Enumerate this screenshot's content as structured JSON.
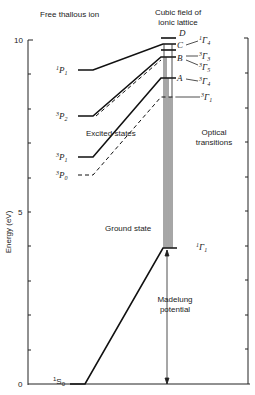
{
  "titles": {
    "left": "Free thallous ion",
    "right_line1": "Cubic field of",
    "right_line2": "ionic lattice"
  },
  "axis": {
    "ylabel": "Energy (eV)",
    "tick_10": "10",
    "tick_5": "5",
    "tick_0": "0"
  },
  "free_ion_levels": {
    "P1_singlet": {
      "sup": "1",
      "letter": "P",
      "sub": "1"
    },
    "P2": {
      "sup": "3",
      "letter": "P",
      "sub": "2"
    },
    "P1_triplet": {
      "sup": "3",
      "letter": "P",
      "sub": "1"
    },
    "P0": {
      "sup": "3",
      "letter": "P",
      "sub": "0"
    },
    "S0": {
      "sup": "1",
      "letter": "S",
      "sub": "0"
    }
  },
  "lattice_levels": {
    "D": "D",
    "C": "C",
    "B": "B",
    "A": "A",
    "C_state": {
      "sup": "1",
      "sub": "4",
      "over": "0"
    },
    "B_state1": {
      "sup": "3",
      "sub": "3",
      "over": "0"
    },
    "B_state2": {
      "sup": "3",
      "sub": "5",
      "over": "0"
    },
    "A_state": {
      "sup": "3",
      "sub": "4",
      "over": "0"
    },
    "lowest_state": {
      "sup": "3",
      "sub": "1",
      "over": "0"
    },
    "ground_state": {
      "sup": "1",
      "sub": "1",
      "over": "+"
    }
  },
  "labels": {
    "excited_states": "Excited states",
    "optical_line1": "Optical",
    "optical_line2": "transitions",
    "ground_state": "Ground state",
    "madelung_line1": "Madelung",
    "madelung_line2": "potential"
  },
  "greek": {
    "gamma": "Γ"
  }
}
